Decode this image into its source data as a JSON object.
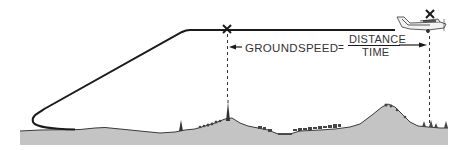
{
  "diagram": {
    "formula": {
      "left_term": "GROUNDSPEED",
      "operator": "=",
      "numerator": "DISTANCE",
      "denominator": "TIME"
    },
    "markers": [
      {
        "name": "start-checkpoint",
        "symbol": "×"
      },
      {
        "name": "end-checkpoint",
        "symbol": "×"
      }
    ],
    "colors": {
      "line": "#1a1a1a",
      "ground": "#bdbdbd",
      "ground_dark": "#8a8a8a",
      "text": "#333333"
    }
  }
}
